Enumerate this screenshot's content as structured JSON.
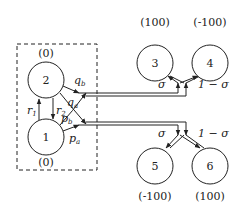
{
  "diagram": {
    "type": "game-tree / state-transition diagram",
    "group_box": {
      "style": "dashed",
      "contains": [
        "2",
        "1"
      ]
    },
    "nodes": [
      {
        "id": "2",
        "label": "2",
        "value": "(0)",
        "value_position": "above"
      },
      {
        "id": "1",
        "label": "1",
        "value": "(0)",
        "value_position": "below"
      },
      {
        "id": "3",
        "label": "3",
        "value": "(100)",
        "value_position": "above"
      },
      {
        "id": "4",
        "label": "4",
        "value": "(-100)",
        "value_position": "above"
      },
      {
        "id": "5",
        "label": "5",
        "value": "(-100)",
        "value_position": "below"
      },
      {
        "id": "6",
        "label": "6",
        "value": "(100)",
        "value_position": "below"
      }
    ],
    "edge_labels": {
      "r1": {
        "base": "r",
        "sub": "1"
      },
      "r2": {
        "base": "r",
        "sub": "2"
      },
      "qb": {
        "base": "q",
        "sub": "b"
      },
      "qa": {
        "base": "q",
        "sub": "a"
      },
      "pb": {
        "base": "p",
        "sub": "b"
      },
      "pa": {
        "base": "p",
        "sub": "a"
      },
      "sigma_top": "σ",
      "one_minus_sigma_top": "1 − σ",
      "sigma_bottom": "σ",
      "one_minus_sigma_bottom": "1 − σ"
    },
    "edges": [
      {
        "from": "1",
        "to": "2",
        "label": "r1"
      },
      {
        "from": "2",
        "to": "1",
        "label": "r2"
      },
      {
        "from": "2",
        "to": "split-top",
        "label": "qb"
      },
      {
        "from": "1",
        "to": "split-top",
        "label": "qa"
      },
      {
        "from": "2",
        "to": "split-bottom",
        "label": "pb"
      },
      {
        "from": "1",
        "to": "split-bottom",
        "label": "pa"
      },
      {
        "from": "split-top",
        "to": "3",
        "label": "σ"
      },
      {
        "from": "split-top",
        "to": "4",
        "label": "1 − σ"
      },
      {
        "from": "split-bottom",
        "to": "5",
        "label": "σ"
      },
      {
        "from": "split-bottom",
        "to": "6",
        "label": "1 − σ"
      }
    ]
  }
}
